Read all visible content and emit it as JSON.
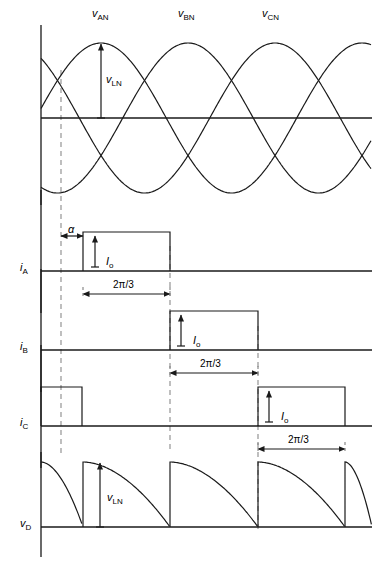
{
  "figure": {
    "width": 377,
    "height": 562,
    "background": "#ffffff",
    "stroke_color": "#1a1a1a",
    "dashed_color": "#808080"
  },
  "traces": {
    "voltage": {
      "name": "phase-voltages",
      "axis_y": 118,
      "axis_x": 41,
      "top": 25,
      "bottom": 205,
      "amplitude": 75,
      "period_px": 261,
      "phase_labels": [
        {
          "id": "v-an",
          "symbol": "v",
          "subscript": "AN",
          "x": 92,
          "y": 8
        },
        {
          "id": "v-bn",
          "symbol": "v",
          "subscript": "BN",
          "x": 178,
          "y": 8
        },
        {
          "id": "v-cn",
          "symbol": "v",
          "subscript": "CN",
          "x": 262,
          "y": 8
        }
      ],
      "annotation": {
        "id": "v-ln-voltage",
        "symbol": "v",
        "subscript": "LN",
        "label_x": 106,
        "label_y": 74,
        "arrow_x": 101,
        "arrow_top": 44,
        "arrow_bottom": 118
      }
    },
    "ia": {
      "name": "current-phase-a",
      "label": {
        "symbol": "i",
        "subscript": "A",
        "x": 20,
        "y": 262
      },
      "baseline_y": 271,
      "pulse_top_y": 232,
      "pulses": [
        {
          "start": 83,
          "end": 170
        }
      ],
      "io_label": {
        "symbol": "I",
        "subscript": "o",
        "x": 106,
        "y": 256
      },
      "io_arrow_x": 95,
      "alpha_label": {
        "text": "α",
        "x": 68,
        "y": 224
      },
      "alpha_arrow": {
        "from": 61,
        "to": 83,
        "y": 236
      },
      "dim_label": {
        "text": "2π/3",
        "x": 113,
        "y": 280
      },
      "dim_arrow": {
        "from": 83,
        "to": 170,
        "y": 294
      }
    },
    "ib": {
      "name": "current-phase-b",
      "label": {
        "symbol": "i",
        "subscript": "B",
        "x": 20,
        "y": 341
      },
      "baseline_y": 350,
      "pulse_top_y": 311,
      "pulses": [
        {
          "start": 170,
          "end": 258
        }
      ],
      "io_label": {
        "symbol": "I",
        "subscript": "o",
        "x": 193,
        "y": 335
      },
      "io_arrow_x": 181,
      "dim_label": {
        "text": "2π/3",
        "x": 200,
        "y": 359
      },
      "dim_arrow": {
        "from": 170,
        "to": 258,
        "y": 373
      }
    },
    "ic": {
      "name": "current-phase-c",
      "label": {
        "symbol": "i",
        "subscript": "C",
        "x": 20,
        "y": 417
      },
      "baseline_y": 426,
      "pulse_top_y": 387,
      "pulses": [
        {
          "start": 41,
          "end": 82
        },
        {
          "start": 258,
          "end": 345
        }
      ],
      "io_label": {
        "symbol": "I",
        "subscript": "o",
        "x": 281,
        "y": 411
      },
      "io_arrow_x": 269,
      "dim_label": {
        "text": "2π/3",
        "x": 288,
        "y": 435
      },
      "dim_arrow": {
        "from": 258,
        "to": 345,
        "y": 449
      }
    },
    "vd": {
      "name": "output-voltage",
      "label": {
        "symbol": "v",
        "subscript": "D",
        "x": 20,
        "y": 518
      },
      "baseline_y": 527,
      "top_y": 462,
      "segment_starts": [
        41,
        83,
        170,
        258,
        345
      ],
      "annotation": {
        "id": "v-ln-output",
        "symbol": "v",
        "subscript": "LN",
        "label_x": 107,
        "label_y": 492,
        "arrow_x": 100,
        "arrow_top": 463,
        "arrow_bottom": 527
      }
    }
  },
  "dashed_lines": [
    {
      "x": 61,
      "y1": 70,
      "y2": 453
    },
    {
      "x": 170,
      "y1": 246,
      "y2": 453
    },
    {
      "x": 258,
      "y1": 326,
      "y2": 530
    }
  ],
  "symbols": {
    "alpha": "α",
    "two_pi_over_three": "2π/3",
    "current_io": "I",
    "current_io_sub": "o",
    "voltage_v": "v",
    "current_i": "i"
  }
}
